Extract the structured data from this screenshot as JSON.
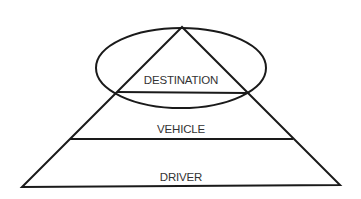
{
  "diagram": {
    "type": "pyramid-with-ellipse",
    "layers": [
      {
        "label": "DESTINATION",
        "position": "top"
      },
      {
        "label": "VEHICLE",
        "position": "middle"
      },
      {
        "label": "DRIVER",
        "position": "bottom"
      }
    ],
    "ellipse_encloses": "DESTINATION",
    "colors": {
      "stroke": "#1a1a1a",
      "text": "#333333",
      "background": "#ffffff"
    }
  }
}
